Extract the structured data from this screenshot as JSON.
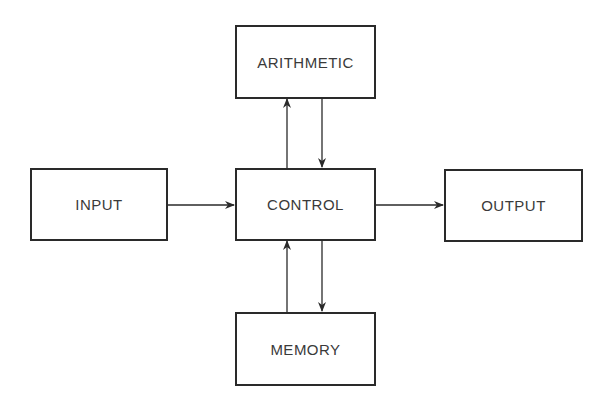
{
  "diagram": {
    "nodes": [
      {
        "id": "arithmetic",
        "label": "ARITHMETIC"
      },
      {
        "id": "input",
        "label": "INPUT"
      },
      {
        "id": "control",
        "label": "CONTROL"
      },
      {
        "id": "output",
        "label": "OUTPUT"
      },
      {
        "id": "memory",
        "label": "MEMORY"
      }
    ],
    "edges": [
      {
        "from": "input",
        "to": "control"
      },
      {
        "from": "control",
        "to": "output"
      },
      {
        "from": "control",
        "to": "arithmetic"
      },
      {
        "from": "arithmetic",
        "to": "control"
      },
      {
        "from": "memory",
        "to": "control"
      },
      {
        "from": "control",
        "to": "memory"
      }
    ],
    "colors": {
      "stroke": "#2a2a2a",
      "text": "#3a3a3a",
      "background": "#ffffff"
    }
  }
}
